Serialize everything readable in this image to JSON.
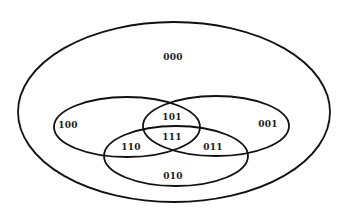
{
  "diagram": {
    "type": "venn",
    "universe": {
      "label": "000",
      "cx": 174,
      "cy": 112,
      "rx": 156,
      "ry": 90
    },
    "sets": [
      {
        "name": "left",
        "cx": 127,
        "cy": 127,
        "rx": 73,
        "ry": 30
      },
      {
        "name": "right",
        "cx": 216,
        "cy": 126,
        "rx": 73,
        "ry": 30
      },
      {
        "name": "bottom",
        "cx": 176,
        "cy": 156,
        "rx": 72,
        "ry": 30
      }
    ],
    "regions": [
      {
        "id": "r000",
        "label": "000",
        "x": 173,
        "y": 57
      },
      {
        "id": "r100",
        "label": "100",
        "x": 68,
        "y": 125
      },
      {
        "id": "r101",
        "label": "101",
        "x": 172,
        "y": 117
      },
      {
        "id": "r001",
        "label": "001",
        "x": 268,
        "y": 124
      },
      {
        "id": "r111",
        "label": "111",
        "x": 172,
        "y": 137
      },
      {
        "id": "r110",
        "label": "110",
        "x": 131,
        "y": 147
      },
      {
        "id": "r011",
        "label": "011",
        "x": 213,
        "y": 147
      },
      {
        "id": "r010",
        "label": "010",
        "x": 173,
        "y": 176
      }
    ],
    "stroke_color": "#111111"
  }
}
